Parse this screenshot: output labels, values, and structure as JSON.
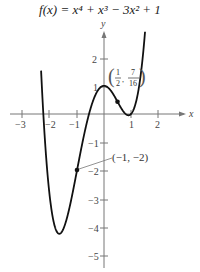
{
  "title": "f(x) = x⁴ + x³ − 3x² + 1",
  "chart_data": {
    "type": "line",
    "function": "x^4 + x^3 - 3x^2 + 1",
    "xlabel": "x",
    "ylabel": "y",
    "xlim": [
      -3.4,
      2.9
    ],
    "ylim": [
      -5.5,
      2.9
    ],
    "x_ticks": [
      -3,
      -2,
      -1,
      1,
      2
    ],
    "x_tick_labels": [
      "−3",
      "−2",
      "−1",
      "1",
      "2"
    ],
    "y_ticks": [
      -5,
      -4,
      -3,
      -2,
      -1,
      1,
      2
    ],
    "y_tick_labels": [
      "−5",
      "−4",
      "−3",
      "−2",
      "−1",
      "1",
      "2"
    ],
    "grid": false,
    "x": [
      -2.33,
      -2.2,
      -2.0,
      -1.8,
      -1.6,
      -1.44,
      -1.2,
      -1.0,
      -0.8,
      -0.5,
      0.0,
      0.3,
      0.5,
      0.7,
      0.83,
      1.0,
      1.2,
      1.4,
      1.52
    ],
    "y": [
      2.6,
      0.39,
      -3.0,
      -3.87,
      -4.13,
      -4.21,
      -3.95,
      -2.0,
      -1.0,
      -0.06,
      1.0,
      0.76,
      0.44,
      0.2,
      0.1,
      0.0,
      0.45,
      1.72,
      2.7
    ],
    "points": [
      {
        "x": -1,
        "y": -2,
        "label": "(−1, −2)"
      },
      {
        "x": 0.5,
        "y": 0.4375,
        "label": "(1/2, 7/16)"
      }
    ]
  },
  "annotations": {
    "point_a": {
      "label": "(−1, −2)"
    },
    "point_b": {
      "open": "(",
      "num1": "1",
      "den1": "2",
      "comma": ",",
      "num2": "7",
      "den2": "16",
      "close": ")"
    }
  },
  "axes": {
    "x_label": "x",
    "y_label": "y"
  },
  "ticks": {
    "x": [
      "−3",
      "−2",
      "−1",
      "1",
      "2"
    ],
    "y": [
      "2",
      "1",
      "−1",
      "−2",
      "−3",
      "−4",
      "−5"
    ]
  }
}
